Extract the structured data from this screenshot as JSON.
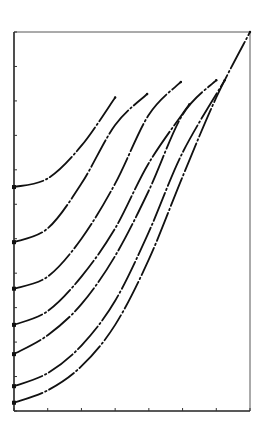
{
  "chart_data": {
    "type": "line",
    "title": "",
    "xlabel": "",
    "ylabel": "",
    "xlim": [
      0,
      7
    ],
    "ylim": [
      0,
      11
    ],
    "grid": false,
    "legend": null,
    "x_ticks": [
      0,
      1,
      2,
      3,
      4,
      5,
      6,
      7
    ],
    "y_ticks": [
      0,
      1,
      2,
      3,
      4,
      5,
      6,
      7,
      8,
      9,
      10,
      11
    ],
    "tick_labels_visible": false,
    "line_style": "dash-dot",
    "line_color": "#111111",
    "series": [
      {
        "name": "curve-1",
        "points": [
          [
            0,
            6.5
          ],
          [
            1,
            6.75
          ],
          [
            2,
            7.7
          ],
          [
            3,
            9.1
          ]
        ]
      },
      {
        "name": "curve-2",
        "points": [
          [
            0,
            4.9
          ],
          [
            1,
            5.3
          ],
          [
            2,
            6.6
          ],
          [
            3,
            8.3
          ],
          [
            3.95,
            9.2
          ]
        ]
      },
      {
        "name": "curve-3",
        "points": [
          [
            0,
            3.55
          ],
          [
            1,
            3.9
          ],
          [
            2,
            5.0
          ],
          [
            3,
            6.6
          ],
          [
            4,
            8.6
          ],
          [
            4.95,
            9.55
          ]
        ]
      },
      {
        "name": "curve-4",
        "points": [
          [
            0,
            2.5
          ],
          [
            1,
            2.9
          ],
          [
            2,
            3.9
          ],
          [
            3,
            5.3
          ],
          [
            4,
            7.2
          ],
          [
            5.2,
            8.9
          ]
        ]
      },
      {
        "name": "curve-5",
        "points": [
          [
            0,
            1.65
          ],
          [
            1,
            2.2
          ],
          [
            2,
            3.1
          ],
          [
            3,
            4.5
          ],
          [
            4,
            6.4
          ],
          [
            5,
            8.6
          ],
          [
            6,
            9.6
          ]
        ]
      },
      {
        "name": "curve-6",
        "points": [
          [
            0,
            0.72
          ],
          [
            1,
            1.1
          ],
          [
            2,
            1.9
          ],
          [
            3,
            3.2
          ],
          [
            4,
            5.2
          ],
          [
            5,
            7.5
          ],
          [
            6.25,
            9.6
          ]
        ]
      },
      {
        "name": "curve-7",
        "points": [
          [
            0,
            0.24
          ],
          [
            1,
            0.6
          ],
          [
            2,
            1.3
          ],
          [
            3,
            2.5
          ],
          [
            4,
            4.4
          ],
          [
            5,
            6.8
          ],
          [
            6,
            9.1
          ],
          [
            7,
            11.0
          ]
        ]
      }
    ]
  },
  "frame": {
    "left": 14,
    "right": 250,
    "top": 32,
    "bottom": 411
  }
}
